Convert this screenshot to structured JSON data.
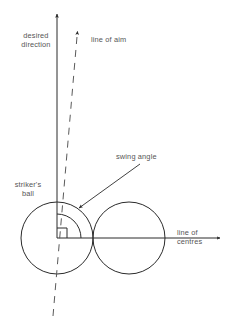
{
  "figure": {
    "background_color": "#ffffff",
    "stroke_color": "#2b2b2b",
    "text_color": "#555555"
  },
  "labels": {
    "desired_direction_line1": "desired",
    "desired_direction_line2": "direction",
    "line_of_aim": "line of aim",
    "swing_angle": "swing angle",
    "strikers_ball_line1": "striker's",
    "strikers_ball_line2": "ball",
    "line_of_centres_line1": "line of",
    "line_of_centres_line2": "centres"
  },
  "geometry": {
    "strikers_ball": {
      "cx": 57,
      "cy": 238,
      "r": 36
    },
    "object_ball": {
      "cx": 129,
      "cy": 238,
      "r": 36
    },
    "desired_direction_arrow": {
      "x1": 57,
      "y1": 238,
      "x2": 57,
      "y2": 11
    },
    "line_of_aim_dashed": {
      "x1": 53,
      "y1": 316,
      "x2": 78,
      "y2": 28
    },
    "line_of_centres_arrow": {
      "x1": 57,
      "y1": 238,
      "x2": 222,
      "y2": 238
    },
    "swing_angle_arc": {
      "cx": 57,
      "cy": 238,
      "r": 24,
      "start_deg": 0,
      "end_deg": 90
    },
    "right_angle_marker": {
      "size": 10
    },
    "swing_angle_pointer": {
      "x1": 140,
      "y1": 164,
      "x2": 76,
      "y2": 211
    }
  }
}
